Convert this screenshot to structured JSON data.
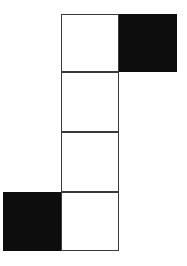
{
  "figure": {
    "background_color": "#ffffff",
    "outline_color": "#3a3a3a",
    "fill_black": "#0d0d0d",
    "fill_white": "#ffffff",
    "stroke_width_px": 1.6,
    "cell_size_px": 58,
    "grid_columns": 3,
    "grid_rows": 4,
    "cell_count": 6,
    "white_cell_count": 4,
    "black_cell_count": 2,
    "cells": [
      {
        "id": "cell-top-white",
        "label": "",
        "fill": "white",
        "grid_col": 1,
        "grid_row": 0,
        "x": 61,
        "y": 14,
        "width": 58,
        "height": 58
      },
      {
        "id": "cell-top-right-black",
        "label": "",
        "fill": "black",
        "grid_col": 2,
        "grid_row": 0,
        "x": 119,
        "y": 14,
        "width": 58,
        "height": 58
      },
      {
        "id": "cell-second-white",
        "label": "",
        "fill": "white",
        "grid_col": 1,
        "grid_row": 1,
        "x": 61,
        "y": 72,
        "width": 58,
        "height": 60
      },
      {
        "id": "cell-third-white",
        "label": "",
        "fill": "white",
        "grid_col": 1,
        "grid_row": 2,
        "x": 61,
        "y": 132,
        "width": 58,
        "height": 60
      },
      {
        "id": "cell-bottom-left-black",
        "label": "",
        "fill": "black",
        "grid_col": 0,
        "grid_row": 3,
        "x": 3,
        "y": 192,
        "width": 58,
        "height": 59
      },
      {
        "id": "cell-bottom-white",
        "label": "",
        "fill": "white",
        "grid_col": 1,
        "grid_row": 3,
        "x": 61,
        "y": 192,
        "width": 58,
        "height": 59
      }
    ]
  }
}
